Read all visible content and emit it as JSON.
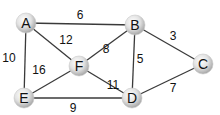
{
  "graph": {
    "nodes": [
      {
        "id": "A",
        "label": "A",
        "x": 26,
        "y": 23
      },
      {
        "id": "B",
        "label": "B",
        "x": 135,
        "y": 25
      },
      {
        "id": "C",
        "label": "C",
        "x": 203,
        "y": 64
      },
      {
        "id": "D",
        "label": "D",
        "x": 132,
        "y": 98
      },
      {
        "id": "E",
        "label": "E",
        "x": 24,
        "y": 98
      },
      {
        "id": "F",
        "label": "F",
        "x": 79,
        "y": 66
      }
    ],
    "edges": [
      {
        "from": "A",
        "to": "B",
        "weight": "6",
        "lx": 80,
        "ly": 19
      },
      {
        "from": "A",
        "to": "F",
        "weight": "12",
        "lx": 66,
        "ly": 44
      },
      {
        "from": "A",
        "to": "E",
        "weight": "10",
        "lx": 9,
        "ly": 62
      },
      {
        "from": "B",
        "to": "F",
        "weight": "8",
        "lx": 106,
        "ly": 53
      },
      {
        "from": "B",
        "to": "D",
        "weight": "5",
        "lx": 140,
        "ly": 63
      },
      {
        "from": "B",
        "to": "C",
        "weight": "3",
        "lx": 173,
        "ly": 40
      },
      {
        "from": "F",
        "to": "E",
        "weight": "16",
        "lx": 39,
        "ly": 74
      },
      {
        "from": "F",
        "to": "D",
        "weight": "11",
        "lx": 113,
        "ly": 89
      },
      {
        "from": "E",
        "to": "D",
        "weight": "9",
        "lx": 73,
        "ly": 112
      },
      {
        "from": "D",
        "to": "C",
        "weight": "7",
        "lx": 173,
        "ly": 92
      }
    ]
  },
  "colors": {
    "edge": "#3a3a3a",
    "node_fill_light": "#f2f2f2",
    "node_fill_dark": "#a8a8a8",
    "text": "#111111"
  }
}
